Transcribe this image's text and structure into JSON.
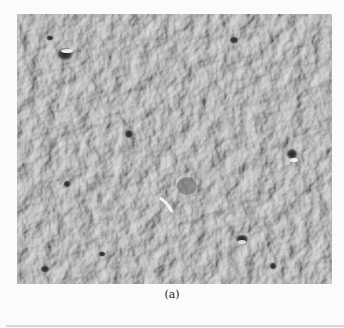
{
  "figure": {
    "image_description": "Grayscale photograph of a cratered lunar surface",
    "caption": "(a)"
  }
}
